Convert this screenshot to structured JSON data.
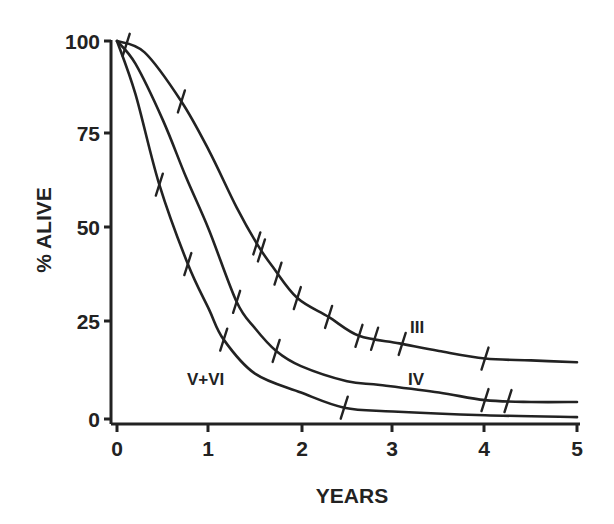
{
  "chart_data": {
    "type": "line",
    "title": "",
    "xlabel": "YEARS",
    "ylabel": "% ALIVE",
    "xlim": [
      0,
      5
    ],
    "ylim": [
      0,
      100
    ],
    "x_ticks": [
      "0",
      "1",
      "2",
      "3",
      "4",
      "5"
    ],
    "y_ticks": [
      "0",
      "25",
      "50",
      "75",
      "100"
    ],
    "grid": false,
    "legend": "inline curve labels",
    "series": [
      {
        "name": "III",
        "points": [
          [
            0,
            100
          ],
          [
            0.3,
            97
          ],
          [
            0.7,
            84
          ],
          [
            1.0,
            71
          ],
          [
            1.3,
            56
          ],
          [
            1.53,
            46
          ],
          [
            1.7,
            40
          ],
          [
            1.96,
            32
          ],
          [
            2.3,
            27
          ],
          [
            2.63,
            22
          ],
          [
            3.07,
            20
          ],
          [
            3.5,
            18
          ],
          [
            4.0,
            16
          ],
          [
            4.5,
            15.5
          ],
          [
            5.0,
            15
          ]
        ],
        "censor_marks_x": [
          0.1,
          0.7,
          1.52,
          1.57,
          1.75,
          1.96,
          2.3,
          2.63,
          2.8,
          3.1,
          4.0
        ]
      },
      {
        "name": "IV",
        "points": [
          [
            0,
            100
          ],
          [
            0.2,
            94
          ],
          [
            0.5,
            79
          ],
          [
            0.75,
            64
          ],
          [
            1.0,
            50
          ],
          [
            1.3,
            31
          ],
          [
            1.5,
            24
          ],
          [
            1.73,
            18
          ],
          [
            2.0,
            14
          ],
          [
            2.5,
            10
          ],
          [
            2.86,
            9
          ],
          [
            3.5,
            7
          ],
          [
            4.0,
            5
          ],
          [
            4.5,
            4.5
          ],
          [
            5.0,
            4.5
          ]
        ],
        "censor_marks_x": [
          1.3,
          1.73,
          4.0,
          4.25
        ]
      },
      {
        "name": "V+VI",
        "points": [
          [
            0,
            100
          ],
          [
            0.2,
            86
          ],
          [
            0.46,
            62
          ],
          [
            0.77,
            41
          ],
          [
            1.0,
            29
          ],
          [
            1.16,
            21
          ],
          [
            1.5,
            12
          ],
          [
            2.0,
            7
          ],
          [
            2.47,
            3
          ],
          [
            3.0,
            2
          ],
          [
            4.0,
            1
          ],
          [
            5.0,
            0.5
          ]
        ],
        "censor_marks_x": [
          0.46,
          0.77,
          1.16,
          2.47
        ]
      }
    ]
  },
  "labels": {
    "xlabel": "YEARS",
    "ylabel": "% ALIVE",
    "series_III": "III",
    "series_IV": "IV",
    "series_VVI": "V+VI",
    "x_ticks": [
      "0",
      "1",
      "2",
      "3",
      "4",
      "5"
    ],
    "y_ticks": [
      "0",
      "25",
      "50",
      "75",
      "100"
    ]
  }
}
